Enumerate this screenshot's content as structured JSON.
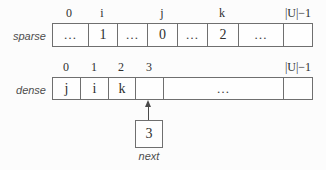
{
  "diagram_title": "sparse-set data structure",
  "colors": {
    "background": "#fcfcfc",
    "border": "#6f6f6f",
    "text": "#2f2f2f",
    "muted_label": "#4d4d4d",
    "arrow": "#4a4a4a"
  },
  "sparse": {
    "label": "sparse",
    "index_labels": [
      {
        "text": "0"
      },
      {
        "text": "i"
      },
      {
        "text": "j"
      },
      {
        "text": "k"
      },
      {
        "text": "|U|−1"
      }
    ],
    "cells": [
      {
        "text": "…"
      },
      {
        "text": "1"
      },
      {
        "text": "…"
      },
      {
        "text": "0"
      },
      {
        "text": "…"
      },
      {
        "text": "2"
      },
      {
        "text": "…"
      },
      {
        "text": ""
      }
    ]
  },
  "dense": {
    "label": "dense",
    "index_labels": [
      {
        "text": "0"
      },
      {
        "text": "1"
      },
      {
        "text": "2"
      },
      {
        "text": "3"
      },
      {
        "text": "|U|−1"
      }
    ],
    "cells": [
      {
        "text": "j"
      },
      {
        "text": "i"
      },
      {
        "text": "k"
      },
      {
        "text": ""
      },
      {
        "text": "…"
      },
      {
        "text": ""
      }
    ]
  },
  "next": {
    "value": "3",
    "label": "next"
  }
}
